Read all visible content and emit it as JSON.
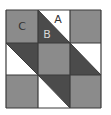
{
  "colors": {
    "gray": "#8b8b8b",
    "dark": "#4b4b4b",
    "white": "#ffffff",
    "line": "#3a3a3a",
    "label_dark": "#333333",
    "label_light": "#d8d8d8"
  },
  "grid": {
    "rows": 3,
    "cols": 3,
    "cells": [
      {
        "row": 0,
        "col": 0,
        "type": "solid",
        "fill": "gray"
      },
      {
        "row": 0,
        "col": 1,
        "type": "split",
        "upper_right": "white",
        "lower_left": "dark"
      },
      {
        "row": 0,
        "col": 2,
        "type": "solid",
        "fill": "gray"
      },
      {
        "row": 1,
        "col": 0,
        "type": "split",
        "upper_right": "dark",
        "lower_left": "white"
      },
      {
        "row": 1,
        "col": 1,
        "type": "solid",
        "fill": "gray"
      },
      {
        "row": 1,
        "col": 2,
        "type": "split",
        "upper_right": "white",
        "lower_left": "dark"
      },
      {
        "row": 2,
        "col": 0,
        "type": "solid",
        "fill": "gray"
      },
      {
        "row": 2,
        "col": 1,
        "type": "split",
        "upper_right": "dark",
        "lower_left": "white"
      },
      {
        "row": 2,
        "col": 2,
        "type": "solid",
        "fill": "gray"
      }
    ]
  },
  "labels": {
    "a": {
      "text": "A",
      "color": "label_dark",
      "row": 0,
      "col": 1,
      "region": "upper_right"
    },
    "b": {
      "text": "B",
      "color": "label_light",
      "row": 0,
      "col": 1,
      "region": "lower_left"
    },
    "c": {
      "text": "C",
      "color": "label_dark",
      "row": 0,
      "col": 0,
      "region": "center"
    }
  }
}
